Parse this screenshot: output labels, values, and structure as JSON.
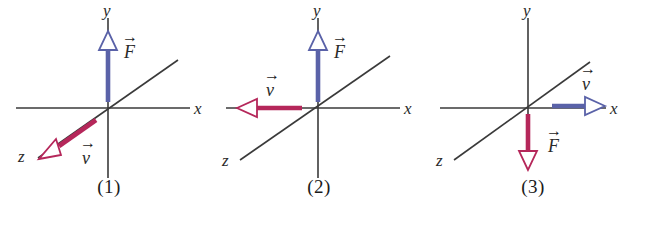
{
  "figure": {
    "background_color": "#ffffff",
    "panel_count": 3
  },
  "colors": {
    "axis": "#3a3a3a",
    "force_blue": "#5a62a8",
    "velocity_red": "#b5275a",
    "arrowhead_fill": "#ffffff",
    "text": "#1a1a1a"
  },
  "panels": [
    {
      "caption": "(1)",
      "axes": {
        "x_label": "x",
        "y_label": "y",
        "z_label": "z"
      },
      "vectors": [
        {
          "symbol": "F",
          "label": "F",
          "color": "#5a62a8",
          "color_name": "blue",
          "direction": "+y",
          "direction_text": "up along y",
          "style": "hollow-arrowhead"
        },
        {
          "symbol": "v",
          "label": "v",
          "color": "#b5275a",
          "color_name": "red",
          "direction": "+z",
          "direction_text": "down-left along z",
          "style": "hollow-arrowhead"
        }
      ]
    },
    {
      "caption": "(2)",
      "axes": {
        "x_label": "x",
        "y_label": "y",
        "z_label": "z"
      },
      "vectors": [
        {
          "symbol": "F",
          "label": "F",
          "color": "#5a62a8",
          "color_name": "blue",
          "direction": "+y",
          "direction_text": "up along y",
          "style": "hollow-arrowhead"
        },
        {
          "symbol": "v",
          "label": "v",
          "color": "#b5275a",
          "color_name": "red",
          "direction": "-x",
          "direction_text": "left along negative x",
          "style": "hollow-arrowhead"
        }
      ]
    },
    {
      "caption": "(3)",
      "axes": {
        "x_label": "x",
        "y_label": "y",
        "z_label": "z"
      },
      "vectors": [
        {
          "symbol": "v",
          "label": "v",
          "color": "#5a62a8",
          "color_name": "blue",
          "direction": "+x",
          "direction_text": "right along positive x",
          "style": "hollow-arrowhead"
        },
        {
          "symbol": "F",
          "label": "F",
          "color": "#b5275a",
          "color_name": "red",
          "direction": "-y",
          "direction_text": "down along negative y",
          "style": "hollow-arrowhead"
        }
      ]
    }
  ]
}
